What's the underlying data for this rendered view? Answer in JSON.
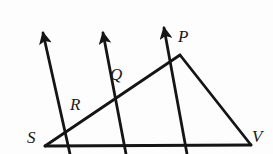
{
  "figure": {
    "background_color": "#fdfdfd",
    "stroke_color": "#151515",
    "stroke_width": 2.6,
    "width": 273,
    "height": 154
  },
  "labels": {
    "S": "S",
    "V": "V",
    "P": "P",
    "Q": "Q",
    "R": "R"
  },
  "points": {
    "S": {
      "x": 45,
      "y": 146
    },
    "V": {
      "x": 251,
      "y": 145
    },
    "P": {
      "x": 180,
      "y": 55
    },
    "Q": {
      "x": 140,
      "y": 88
    },
    "R": {
      "x": 96,
      "y": 113
    },
    "base_cross_1": {
      "x": 124,
      "y": 146
    },
    "base_cross_2": {
      "x": 185,
      "y": 146
    },
    "arrow_tip_1": {
      "x": 41,
      "y": 31
    },
    "arrow_tip_2": {
      "x": 101,
      "y": 31
    },
    "arrow_tip_3": {
      "x": 162,
      "y": 26
    }
  },
  "segments": [
    {
      "name": "base-line-SV",
      "from": "S",
      "to": "V"
    },
    {
      "name": "line-S-to-P",
      "from": "S",
      "to": "P"
    },
    {
      "name": "line-P-to-V",
      "from": "P",
      "to": "V"
    }
  ],
  "rays": [
    {
      "name": "ray-through-R",
      "from": "R",
      "to": "arrow_tip_1"
    },
    {
      "name": "ray-through-Q",
      "from": "base_cross_1",
      "to": "arrow_tip_2"
    },
    {
      "name": "ray-through-P",
      "from": "base_cross_2",
      "to": "arrow_tip_3"
    }
  ]
}
